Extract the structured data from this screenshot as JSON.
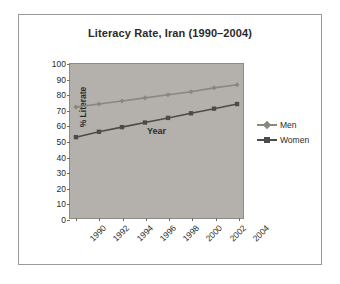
{
  "figure": {
    "title": "Literacy Rate, Iran (1990–2004)",
    "border_color": "#9a9a9a",
    "background": "#ffffff",
    "plot_background": "#b4b1ac"
  },
  "chart_data": {
    "type": "line",
    "title": "Literacy Rate, Iran (1990–2004)",
    "xlabel": "Year",
    "ylabel": "% Literate",
    "categories": [
      "1990",
      "1992",
      "1994",
      "1996",
      "1998",
      "2000",
      "2002",
      "2004"
    ],
    "x": [
      1990,
      1992,
      1994,
      1996,
      1998,
      2000,
      2002,
      2004
    ],
    "series": [
      {
        "name": "Men",
        "color": "#8a8782",
        "marker": "diamond",
        "values": [
          72,
          74,
          76,
          78,
          80,
          82,
          84.5,
          86.5
        ]
      },
      {
        "name": "Women",
        "color": "#4d4b49",
        "marker": "square",
        "values": [
          52.5,
          56,
          59,
          62,
          65,
          68,
          71,
          74
        ]
      }
    ],
    "ylim": [
      0,
      100
    ],
    "ytick_step": 10,
    "yticks": [
      0,
      10,
      20,
      30,
      40,
      50,
      60,
      70,
      80,
      90,
      100
    ],
    "xtick_rotation": -45,
    "grid": false,
    "legend_position": "right"
  },
  "legend": {
    "items": [
      {
        "label": "Men",
        "color": "#8a8782",
        "marker": "diamond"
      },
      {
        "label": "Women",
        "color": "#4d4b49",
        "marker": "square"
      }
    ]
  }
}
